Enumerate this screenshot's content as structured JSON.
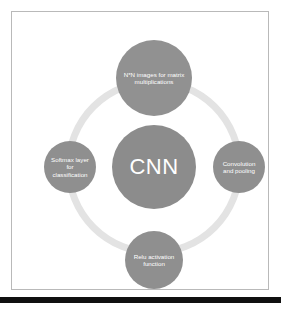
{
  "diagram": {
    "type": "cycle-diagram",
    "center": {
      "id": "cnn-hub",
      "label": "CNN",
      "color": "#8c8c8c",
      "text_color": "#ffffff"
    },
    "ring": {
      "color": "#e3e3e3",
      "thickness_px": 7
    },
    "nodes": [
      {
        "id": "matrix-multiplications",
        "position": "top",
        "label": "N*N images for matrix multiplications",
        "color": "#919191",
        "text_color": "#ffffff"
      },
      {
        "id": "convolution-and-pooling",
        "position": "right",
        "label": "Convolution and pooling",
        "color": "#8f8f8f",
        "text_color": "#ffffff"
      },
      {
        "id": "relu-activation-function",
        "position": "bottom",
        "label": "Relu activation function",
        "color": "#8f8f8f",
        "text_color": "#ffffff"
      },
      {
        "id": "softmax-layer-for-classification",
        "position": "left",
        "label": "Softmax layer for classification",
        "color": "#8f8f8f",
        "text_color": "#ffffff"
      }
    ]
  },
  "frame": {
    "border_color": "#b9b9b9",
    "background": "#ffffff"
  },
  "bottom_band": {
    "color": "#101010"
  }
}
